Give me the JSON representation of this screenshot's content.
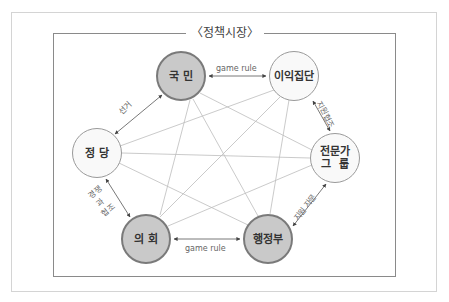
{
  "title": "〈정책시장〉",
  "nodes": {
    "citizens": {
      "label": "국 민",
      "style": "dark"
    },
    "interest_groups": {
      "label": "이익집단",
      "style": "light"
    },
    "party": {
      "label": "정 당",
      "style": "light"
    },
    "experts": {
      "label": "전문가\n그  룹",
      "style": "light"
    },
    "assembly": {
      "label": "의 회",
      "style": "dark"
    },
    "executive": {
      "label": "행정부",
      "style": "dark"
    }
  },
  "edges": {
    "citizens_interest": "game rule",
    "citizens_party": "선거",
    "interest_experts": "지원협조",
    "party_assembly_line1": "경쟁",
    "party_assembly_line2": "과",
    "party_assembly_line3": "협조",
    "assembly_executive": "game rule",
    "executive_experts": "지원 자문"
  },
  "colors": {
    "dark_node_fill": "#c9c9c9",
    "dark_node_border": "#7a7a7a",
    "light_node_fill": "#f9f9f9",
    "light_node_border": "#9a9a9a",
    "mesh_line": "#bdbdbd",
    "arrow_line": "#555555"
  }
}
